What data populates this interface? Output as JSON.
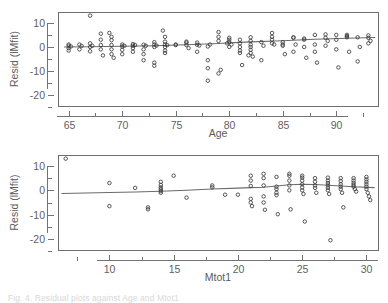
{
  "figure": {
    "background": "#ffffff",
    "point_color": "#3a3a3a",
    "line_color": "#6b6b6b",
    "axis_color": "#6e6e6e",
    "text_color": "#5a5a5a",
    "caption": "Fig. 4. Residual  plots  against  Age  and  Mtot1 "
  },
  "chart_data": [
    {
      "type": "scatter",
      "id": "resid-vs-age",
      "title": "",
      "xlabel": "Age",
      "ylabel": "Resid (lMfit)",
      "xlim": [
        64.0,
        93.9
      ],
      "ylim": [
        -24.5,
        14.5
      ],
      "grid": false,
      "legend": null,
      "xticks": [
        65,
        70,
        75,
        80,
        85,
        90
      ],
      "xtick_labels": [
        "65",
        "70",
        "75",
        "80",
        "85",
        "90"
      ],
      "xminorticks": [
        67.5,
        72.5,
        77.5,
        82.5,
        87.5,
        92.5
      ],
      "yticks": [
        10,
        0,
        -10,
        -20
      ],
      "ytick_labels": [
        "10",
        "0",
        "-10",
        "-20"
      ],
      "yminorticks": [
        5,
        -5,
        -15,
        -25
      ],
      "marker": "open-circle",
      "x": [
        65,
        65,
        65,
        65,
        65.2,
        66,
        66,
        66.2,
        67,
        67,
        67,
        67,
        67.2,
        68,
        68,
        68,
        68,
        68.2,
        68.8,
        69,
        69,
        69,
        69,
        69,
        69.2,
        70,
        70,
        70,
        70,
        70.2,
        71,
        71,
        71,
        71,
        71.2,
        72,
        72,
        72,
        72,
        72.2,
        73,
        73,
        73,
        73,
        73,
        73.2,
        73.8,
        74,
        74,
        74,
        74,
        74,
        74,
        74.2,
        75,
        75,
        76,
        76,
        76,
        76.2,
        77,
        77,
        77,
        77.2,
        78,
        78,
        78,
        78,
        78.2,
        79,
        79,
        79,
        79,
        79.2,
        79.8,
        80,
        80,
        80,
        80,
        80.2,
        81,
        81,
        81,
        81,
        81,
        81.2,
        81.8,
        82,
        82,
        82,
        82,
        82,
        82,
        82.2,
        83,
        83,
        83.2,
        84,
        84,
        84,
        84,
        84.2,
        85,
        85,
        85,
        85.2,
        86,
        86,
        86,
        86.2,
        87,
        87,
        87,
        87.2,
        88,
        88,
        88,
        88.2,
        89,
        89,
        89,
        89.2,
        90,
        90,
        90,
        90.2,
        91,
        91,
        91,
        91.2,
        92,
        92,
        92.2,
        93,
        93,
        93,
        93.2
      ],
      "y": [
        0.5,
        -0.5,
        -1.5,
        1.0,
        0.2,
        1.0,
        -1.0,
        0.4,
        13.0,
        1.5,
        0.0,
        -1.8,
        0.5,
        5.5,
        3.0,
        0.8,
        -1.0,
        -3.5,
        5.8,
        4.2,
        2.8,
        0.8,
        -1.0,
        -3.0,
        -4.5,
        1.0,
        0.2,
        -1.2,
        -3.0,
        0.5,
        1.2,
        0.5,
        -0.5,
        -2.0,
        0.8,
        0.9,
        -1.0,
        -3.0,
        -5.5,
        0.5,
        2.0,
        1.0,
        0.0,
        -6.5,
        -7.8,
        0.6,
        6.8,
        4.2,
        2.2,
        1.0,
        0.0,
        -1.5,
        -2.5,
        0.8,
        1.0,
        0.8,
        2.2,
        1.8,
        0.8,
        -0.5,
        1.8,
        0.9,
        -2.0,
        0.6,
        0.2,
        -5.5,
        -8.8,
        -14.0,
        1.0,
        6.2,
        4.2,
        2.5,
        -11.0,
        -9.5,
        1.5,
        3.8,
        3.0,
        2.0,
        0.0,
        1.0,
        3.0,
        1.5,
        0.0,
        -1.5,
        -2.5,
        -7.5,
        -3.5,
        4.0,
        2.5,
        1.0,
        0.0,
        -1.2,
        -2.5,
        -4.0,
        -5.5,
        2.0,
        0.5,
        1.5,
        5.8,
        4.2,
        3.0,
        1.0,
        0.5,
        2.0,
        1.0,
        -3.0,
        -2.0,
        4.0,
        3.8,
        1.0,
        3.5,
        3.0,
        0.0,
        -4.5,
        -2.0,
        5.0,
        1.0,
        -6.5,
        0.5,
        5.2,
        3.8,
        2.5,
        3.0,
        5.0,
        -1.0,
        -8.5,
        4.5,
        5.0,
        4.0,
        -2.0,
        -6.0,
        4.0,
        0.0,
        1.5,
        4.8,
        3.8,
        2.5,
        3.5
      ],
      "trend_x": [
        64.6,
        67,
        70,
        73,
        76,
        79,
        80.5,
        82,
        85,
        88,
        91,
        93.6
      ],
      "trend_y": [
        0.0,
        0.05,
        0.3,
        0.5,
        0.9,
        1.4,
        1.8,
        2.1,
        2.6,
        3.2,
        3.6,
        3.9
      ]
    },
    {
      "type": "scatter",
      "id": "resid-vs-mtot1",
      "title": "",
      "xlabel": "Mtot1",
      "ylabel": "Resid (lMfit)",
      "xlim": [
        6.0,
        30.9
      ],
      "ylim": [
        -24.5,
        14.5
      ],
      "grid": false,
      "legend": null,
      "xticks": [
        10,
        15,
        20,
        25,
        30
      ],
      "xtick_labels": [
        "10",
        "15",
        "20",
        "25",
        "30"
      ],
      "xminorticks": [
        7.5,
        12.5,
        17.5,
        22.5,
        27.5
      ],
      "yticks": [
        10,
        0,
        -10,
        -20
      ],
      "ytick_labels": [
        "10",
        "0",
        "-10",
        "-20"
      ],
      "yminorticks": [
        5,
        -5,
        -15,
        -25
      ],
      "marker": "open-circle",
      "x": [
        6.6,
        10,
        10,
        12,
        13,
        13,
        14,
        14,
        14,
        14,
        14,
        14,
        15,
        16,
        18,
        18,
        19,
        20,
        21,
        21,
        21,
        21,
        21,
        21.1,
        22,
        22,
        22,
        22,
        22,
        22.1,
        23,
        23,
        23,
        23,
        23,
        23.1,
        24,
        24,
        24,
        24,
        24,
        24.1,
        25,
        25,
        25,
        25,
        25,
        25,
        25.1,
        25.2,
        26,
        26,
        26,
        26,
        26.1,
        27,
        27,
        27,
        27,
        27,
        27,
        27.1,
        27.2,
        28,
        28,
        28,
        28,
        28,
        28.1,
        28.2,
        29,
        29,
        29,
        29,
        29,
        29.1,
        29.2,
        30,
        30,
        30,
        30,
        30,
        30,
        30.1,
        30.2,
        30.3
      ],
      "y": [
        13.0,
        3.0,
        -6.5,
        1.0,
        -7.0,
        -7.8,
        3.5,
        2.2,
        1.2,
        0.5,
        -0.3,
        -1.0,
        6.0,
        -3.0,
        2.0,
        1.2,
        -1.8,
        -1.8,
        6.0,
        4.0,
        1.8,
        -3.5,
        -5.0,
        -6.5,
        6.8,
        5.0,
        2.0,
        -2.5,
        -5.0,
        -8.0,
        5.5,
        1.5,
        0.5,
        -1.0,
        -2.0,
        -9.8,
        6.8,
        6.0,
        4.0,
        2.0,
        0.0,
        -7.8,
        6.0,
        5.2,
        4.0,
        2.5,
        1.2,
        0.0,
        -1.5,
        -12.8,
        5.0,
        3.5,
        2.0,
        1.0,
        -1.0,
        5.2,
        4.0,
        3.0,
        2.0,
        1.0,
        0.0,
        -1.5,
        -20.5,
        5.0,
        3.8,
        2.5,
        1.5,
        0.5,
        -1.0,
        -7.0,
        5.0,
        4.0,
        3.0,
        2.2,
        1.5,
        0.5,
        -0.5,
        5.5,
        4.5,
        3.5,
        2.5,
        1.5,
        0.5,
        -1.0,
        -2.5,
        -4.0
      ],
      "trend_x": [
        6.3,
        10,
        12,
        14,
        16,
        18,
        20,
        21,
        22,
        23,
        24,
        25,
        26,
        27,
        28,
        29,
        30.6
      ],
      "trend_y": [
        -1.3,
        -0.9,
        -0.7,
        -0.4,
        0.0,
        0.5,
        0.9,
        1.1,
        1.3,
        1.8,
        2.3,
        2.5,
        2.4,
        2.1,
        1.8,
        1.5,
        1.1
      ]
    }
  ]
}
